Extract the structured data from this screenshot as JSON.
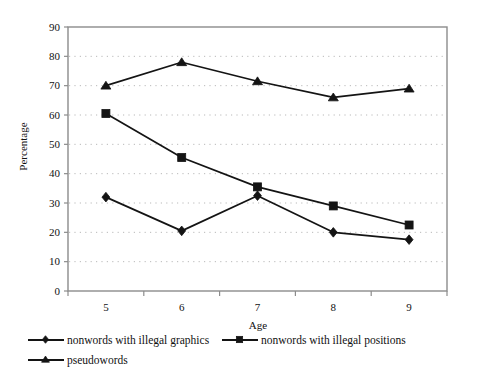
{
  "chart_data": {
    "type": "line",
    "title": "",
    "xlabel": "Age",
    "ylabel": "Percentage",
    "categories": [
      "5",
      "6",
      "7",
      "8",
      "9"
    ],
    "x": [
      5,
      6,
      7,
      8,
      9
    ],
    "ylim": [
      0,
      90
    ],
    "ytick_step": 10,
    "yticks": [
      "90",
      "80",
      "70",
      "60",
      "50",
      "40",
      "30",
      "20",
      "10",
      "0"
    ],
    "grid": "horizontal-dotted",
    "legend_position": "below-plot",
    "series": [
      {
        "name": "nonwords with illegal graphics",
        "marker": "diamond",
        "color": "#141414",
        "values": [
          32,
          20.5,
          32.5,
          20,
          17.5
        ]
      },
      {
        "name": "nonwords with illegal positions",
        "marker": "square",
        "color": "#141414",
        "values": [
          60.5,
          45.5,
          35.5,
          29,
          22.5
        ]
      },
      {
        "name": "pseudowords",
        "marker": "triangle",
        "color": "#141414",
        "values": [
          70,
          78,
          71.5,
          66,
          69
        ]
      }
    ]
  },
  "colors": {
    "plot_border": "#8c8c8c",
    "gridline": "#b9b9b9",
    "series_line": "#141414",
    "background": "#ffffff",
    "text": "#111111"
  }
}
